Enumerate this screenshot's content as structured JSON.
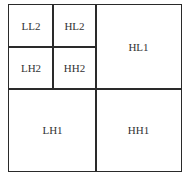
{
  "diagram": {
    "title": "",
    "type": "wavelet-subband-decomposition",
    "cells": [
      {
        "id": "ll2",
        "label": "LL2"
      },
      {
        "id": "hl2",
        "label": "HL2"
      },
      {
        "id": "lh2",
        "label": "LH2"
      },
      {
        "id": "hh2",
        "label": "HH2"
      },
      {
        "id": "hl1",
        "label": "HL1"
      },
      {
        "id": "lh1",
        "label": "LH1"
      },
      {
        "id": "hh1",
        "label": "HH1"
      }
    ]
  }
}
